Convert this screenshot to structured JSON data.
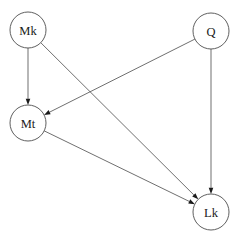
{
  "diagram": {
    "type": "directed-graph",
    "background_color": "#ffffff",
    "node_fill_color": "#ffffff",
    "node_stroke_color": "#4d4d4d",
    "edge_color": "#555555",
    "label_color": "#1a1a1a",
    "node_radius": 18,
    "canvas": {
      "width": 239,
      "height": 241
    },
    "nodes": [
      {
        "id": "Mk",
        "label": "Mk",
        "cx": 28,
        "cy": 30
      },
      {
        "id": "Q",
        "label": "Q",
        "cx": 211,
        "cy": 31
      },
      {
        "id": "Mt",
        "label": "Mt",
        "cx": 28,
        "cy": 123
      },
      {
        "id": "Lk",
        "label": "Lk",
        "cx": 211,
        "cy": 212
      }
    ],
    "edges": [
      {
        "id": "mk-mt",
        "from": "Mk",
        "to": "Mt",
        "directed": true
      },
      {
        "id": "mk-lk",
        "from": "Mk",
        "to": "Lk",
        "directed": true
      },
      {
        "id": "q-mt",
        "from": "Q",
        "to": "Mt",
        "directed": true
      },
      {
        "id": "q-lk",
        "from": "Q",
        "to": "Lk",
        "directed": true
      },
      {
        "id": "mt-lk",
        "from": "Mt",
        "to": "Lk",
        "directed": true
      }
    ]
  }
}
